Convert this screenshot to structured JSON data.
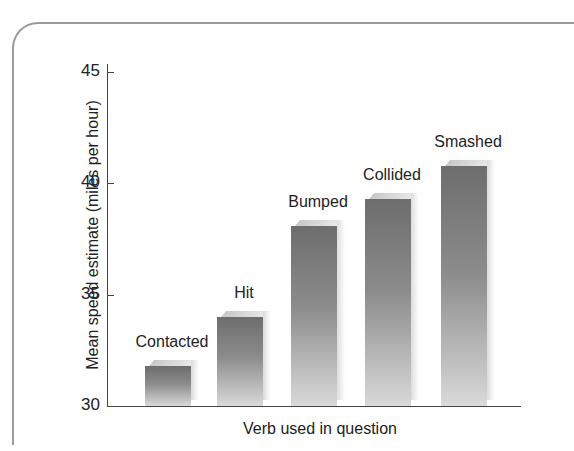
{
  "chart_data": {
    "type": "bar",
    "title": "",
    "xlabel": "Verb used in question",
    "ylabel": "Mean speed estimate (miles per hour)",
    "categories": [
      "Contacted",
      "Hit",
      "Bumped",
      "Collided",
      "Smashed"
    ],
    "values": [
      31.8,
      34.0,
      38.1,
      39.3,
      40.8
    ],
    "ylim": [
      30,
      45
    ],
    "yticks": [
      "30",
      "35",
      "40",
      "45"
    ],
    "grid": false,
    "legend": null,
    "data_labels": [
      "Contacted",
      "Hit",
      "Bumped",
      "Collided",
      "Smashed"
    ],
    "style": "3D grayscale gradient bars"
  }
}
